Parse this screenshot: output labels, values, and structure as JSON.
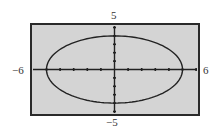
{
  "chart_data": {
    "type": "line",
    "title": "",
    "xlabel": "",
    "ylabel": "",
    "xlim": [
      -6,
      6
    ],
    "ylim": [
      -5,
      5
    ],
    "x_tick_step": 1,
    "y_tick_step": 1,
    "grid": false,
    "legend": null,
    "window_labels": {
      "xmin": "−6",
      "xmax": "6",
      "ymin": "−5",
      "ymax": "5"
    },
    "series": [
      {
        "name": "ellipse",
        "equation": "x^2/25 + y^2/16 = 1",
        "semi_major_x": 5,
        "semi_minor_y": 4,
        "center": [
          0,
          0
        ],
        "points": [
          [
            5,
            0
          ],
          [
            4,
            2.4
          ],
          [
            3,
            3.2
          ],
          [
            2,
            3.67
          ],
          [
            1,
            3.92
          ],
          [
            0,
            4
          ],
          [
            -1,
            3.92
          ],
          [
            -2,
            3.67
          ],
          [
            -3,
            3.2
          ],
          [
            -4,
            2.4
          ],
          [
            -5,
            0
          ],
          [
            -4,
            -2.4
          ],
          [
            -3,
            -3.2
          ],
          [
            -2,
            -3.67
          ],
          [
            -1,
            -3.92
          ],
          [
            0,
            -4
          ],
          [
            1,
            -3.92
          ],
          [
            2,
            -3.67
          ],
          [
            3,
            -3.2
          ],
          [
            4,
            -2.4
          ],
          [
            5,
            0
          ]
        ]
      }
    ]
  },
  "colors": {
    "screen_bg": "#d4d4d4",
    "frame": "#2a2a2a",
    "curve": "#222222",
    "axis": "#222222"
  }
}
